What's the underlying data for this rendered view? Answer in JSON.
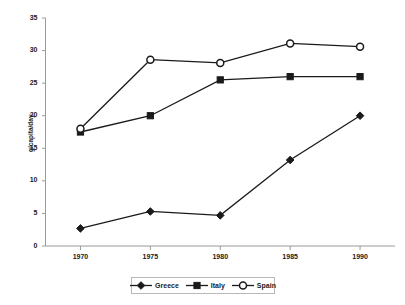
{
  "chart_data": {
    "type": "line",
    "title": "",
    "xlabel": "",
    "ylabel": "g/capita/day",
    "categories": [
      "1970",
      "1975",
      "1980",
      "1985",
      "1990"
    ],
    "x": [
      1970,
      1975,
      1980,
      1985,
      1990
    ],
    "xlim": [
      1967.5,
      1992.5
    ],
    "ylim": [
      0,
      35
    ],
    "yticks": [
      0,
      5,
      10,
      15,
      20,
      25,
      30,
      35
    ],
    "ytick_labels": [
      "0",
      "5",
      "10",
      "15",
      "20",
      "25",
      "30",
      "35"
    ],
    "grid": false,
    "legend_position": "bottom",
    "series": [
      {
        "name": "Greece",
        "marker": "filled-diamond",
        "color": "#1a1a1a",
        "values": [
          2.7,
          5.3,
          4.7,
          13.2,
          20.0
        ]
      },
      {
        "name": "Italy",
        "marker": "filled-square",
        "color": "#1a1a1a",
        "values": [
          17.5,
          20.0,
          25.5,
          26.0,
          26.0
        ]
      },
      {
        "name": "Spain",
        "marker": "open-circle",
        "color": "#1a1a1a",
        "values": [
          18.0,
          28.6,
          28.1,
          31.1,
          30.6
        ]
      }
    ]
  },
  "legend": {
    "entries": [
      {
        "label": "Greece",
        "marker": "filled-diamond"
      },
      {
        "label": "Italy",
        "marker": "filled-square"
      },
      {
        "label": "Spain",
        "marker": "open-circle"
      }
    ]
  },
  "colors": {
    "line": "#1a1a1a",
    "axis": "#9a9a9a",
    "text": "#1a1a1a",
    "background": "#ffffff",
    "legend_border": "#b8b8b8"
  }
}
